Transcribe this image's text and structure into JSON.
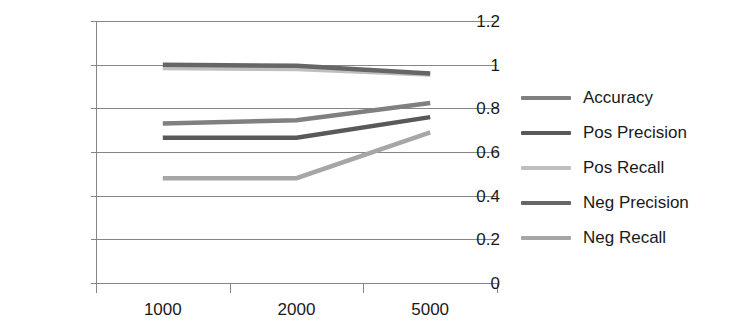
{
  "chart_data": {
    "type": "line",
    "title": "",
    "xlabel": "",
    "ylabel": "",
    "categories": [
      "1000",
      "2000",
      "5000"
    ],
    "ylim": [
      0,
      1.2
    ],
    "yticks": [
      "0",
      "0.2",
      "0.4",
      "0.6",
      "0.8",
      "1",
      "1.2"
    ],
    "ytick_values": [
      0,
      0.2,
      0.4,
      0.6,
      0.8,
      1.0,
      1.2
    ],
    "grid": true,
    "legend_position": "right",
    "series": [
      {
        "name": "Accuracy",
        "color": "#808080",
        "values": [
          0.73,
          0.745,
          0.825
        ]
      },
      {
        "name": "Pos Precision",
        "color": "#595959",
        "values": [
          0.665,
          0.665,
          0.76
        ]
      },
      {
        "name": "Pos Recall",
        "color": "#bfbfbf",
        "values": [
          0.985,
          0.98,
          0.955
        ]
      },
      {
        "name": "Neg Precision",
        "color": "#666666",
        "values": [
          1.0,
          0.995,
          0.96
        ]
      },
      {
        "name": "Neg Recall",
        "color": "#a6a6a6",
        "values": [
          0.48,
          0.48,
          0.69
        ]
      }
    ]
  },
  "axis": {
    "grid_color": "#868686",
    "axis_color": "#868686",
    "tick_color": "#868686"
  }
}
